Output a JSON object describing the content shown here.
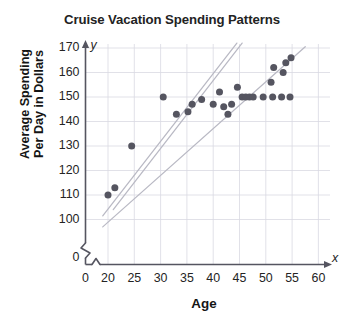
{
  "chart_data": {
    "type": "scatter",
    "title": "Cruise Vacation Spending Patterns",
    "xlabel": "Age",
    "ylabel": "Average Spending Per Day in Dollars",
    "ylabel_line1": "Average Spending",
    "ylabel_line2": "Per Day in Dollars",
    "xlim": [
      20,
      60
    ],
    "ylim": [
      100,
      170
    ],
    "x_axis_break": true,
    "y_axis_break": true,
    "x_origin_label": "0",
    "y_origin_label": "0",
    "x_axis_letter": "x",
    "y_axis_letter": "y",
    "grid": true,
    "legend": "none",
    "xticks": [
      20,
      25,
      30,
      35,
      40,
      45,
      50,
      55,
      60
    ],
    "xtick_labels": [
      "20",
      "25",
      "30",
      "35",
      "40",
      "45",
      "50",
      "55",
      "60"
    ],
    "yticks": [
      100,
      110,
      120,
      130,
      140,
      150,
      160,
      170
    ],
    "ytick_labels": [
      "100",
      "110",
      "120",
      "130",
      "140",
      "150",
      "160",
      "170"
    ],
    "point_color": "#555560",
    "trendline_color": "#b9b9c4",
    "grid_color": "#d9d9e2",
    "axis_color": "#555560",
    "points": [
      {
        "x": 20.0,
        "y": 110
      },
      {
        "x": 21.3,
        "y": 113
      },
      {
        "x": 24.5,
        "y": 130
      },
      {
        "x": 30.5,
        "y": 150
      },
      {
        "x": 33.0,
        "y": 143
      },
      {
        "x": 35.2,
        "y": 144
      },
      {
        "x": 36.0,
        "y": 147
      },
      {
        "x": 37.8,
        "y": 149
      },
      {
        "x": 40.0,
        "y": 147
      },
      {
        "x": 41.2,
        "y": 152
      },
      {
        "x": 42.0,
        "y": 146
      },
      {
        "x": 42.8,
        "y": 143
      },
      {
        "x": 43.5,
        "y": 147
      },
      {
        "x": 44.6,
        "y": 154
      },
      {
        "x": 45.5,
        "y": 150
      },
      {
        "x": 46.2,
        "y": 150
      },
      {
        "x": 46.9,
        "y": 150
      },
      {
        "x": 47.6,
        "y": 150
      },
      {
        "x": 49.5,
        "y": 150
      },
      {
        "x": 51.0,
        "y": 156
      },
      {
        "x": 51.3,
        "y": 150
      },
      {
        "x": 51.5,
        "y": 162
      },
      {
        "x": 53.0,
        "y": 150
      },
      {
        "x": 53.3,
        "y": 160
      },
      {
        "x": 53.8,
        "y": 164
      },
      {
        "x": 54.8,
        "y": 166
      },
      {
        "x": 54.6,
        "y": 150
      }
    ],
    "trendlines": [
      {
        "name": "upper-band-line",
        "x1": 19.0,
        "y1": 101.5,
        "x2": 44.5,
        "y2": 172.0
      },
      {
        "name": "lower-band-line",
        "x1": 19.0,
        "y1": 97.0,
        "x2": 57.5,
        "y2": 170.5
      },
      {
        "name": "best-fit-line",
        "x1": 21.0,
        "y1": 104.0,
        "x2": 45.5,
        "y2": 172.0
      }
    ]
  }
}
